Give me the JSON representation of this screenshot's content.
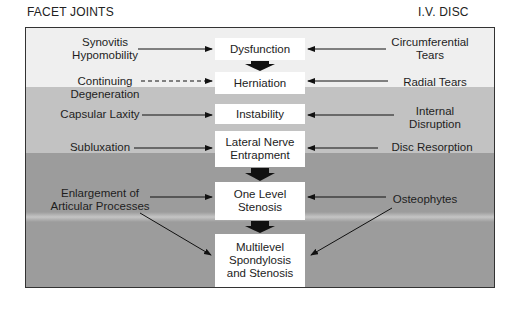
{
  "headers": {
    "left": "FACET JOINTS",
    "right": "I.V. DISC"
  },
  "colors": {
    "band_light": "#efefef",
    "band_mid": "#c2c2c2",
    "band_dark": "#9c9c9c",
    "box_fill": "#ffffff",
    "arrow": "#111111"
  },
  "center_boxes": [
    {
      "id": "dysfunction",
      "label": "Dysfunction"
    },
    {
      "id": "herniation",
      "label": "Herniation"
    },
    {
      "id": "instability",
      "label": "Instability"
    },
    {
      "id": "lateral-nerve-entrapment",
      "label": "Lateral Nerve\nEntrapment"
    },
    {
      "id": "one-level-stenosis",
      "label": "One Level\nStenosis"
    },
    {
      "id": "multilevel-spondylosis",
      "label": "Multilevel\nSpondylosis\nand Stenosis"
    }
  ],
  "facet_labels": [
    {
      "id": "synovitis",
      "label": "Synovitis\nHypomobility",
      "target": "Dysfunction",
      "style": "solid"
    },
    {
      "id": "continuing-degeneration",
      "label": "Continuing\nDegeneration",
      "target": "Herniation",
      "style": "dashed"
    },
    {
      "id": "capsular-laxity",
      "label": "Capsular Laxity",
      "target": "Instability",
      "style": "solid"
    },
    {
      "id": "subluxation",
      "label": "Subluxation",
      "target": "Lateral Nerve Entrapment",
      "style": "solid"
    },
    {
      "id": "enlargement",
      "label": "Enlargement of\nArticular Processes",
      "target": "One Level Stenosis; Multilevel Spondylosis and Stenosis",
      "style": "solid"
    }
  ],
  "disc_labels": [
    {
      "id": "circumferential-tears",
      "label": "Circumferential\nTears",
      "target": "Dysfunction",
      "style": "solid"
    },
    {
      "id": "radial-tears",
      "label": "Radial Tears",
      "target": "Herniation",
      "style": "solid"
    },
    {
      "id": "internal-disruption",
      "label": "Internal\nDisruption",
      "target": "Instability",
      "style": "solid"
    },
    {
      "id": "disc-resorption",
      "label": "Disc Resorption",
      "target": "Lateral Nerve Entrapment",
      "style": "solid"
    },
    {
      "id": "osteophytes",
      "label": "Osteophytes",
      "target": "One Level Stenosis; Multilevel Spondylosis and Stenosis",
      "style": "solid"
    }
  ]
}
